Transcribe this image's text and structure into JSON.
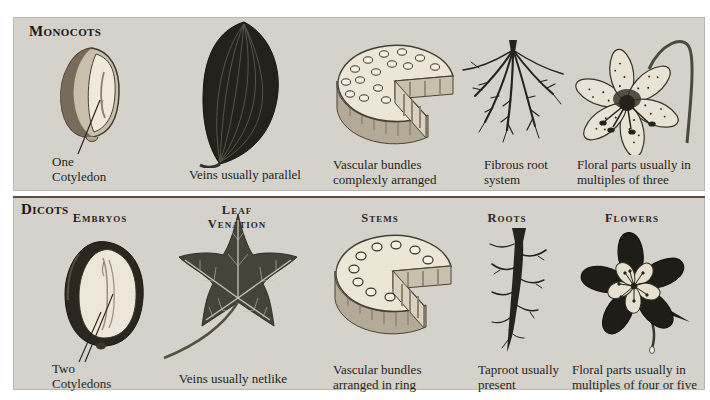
{
  "figure": {
    "colors": {
      "page_bg": "#ffffff",
      "panel_bg": "#d4d2cb",
      "divider": "#5d4a41",
      "text": "#241f19",
      "ink_dark": "#26221c",
      "paper_light": "#ece7d8"
    },
    "monocots": {
      "title": "Monocots",
      "columns": [
        {
          "illustration": "corn-seed",
          "caption": "One Cotyledon"
        },
        {
          "illustration": "parallel-vein-leaf",
          "caption": "Veins usually parallel"
        },
        {
          "illustration": "monocot-stem-cross-section",
          "caption": "Vascular bundles complexly arranged"
        },
        {
          "illustration": "fibrous-roots",
          "caption": "Fibrous root system"
        },
        {
          "illustration": "lily-flower",
          "caption": "Floral parts usually in multiples of three"
        }
      ]
    },
    "dicots": {
      "title": "Dicots",
      "headers": [
        "Embryos",
        "Leaf Venation",
        "Stems",
        "Roots",
        "Flowers"
      ],
      "columns": [
        {
          "illustration": "bean-seed",
          "caption": "Two Cotyledons"
        },
        {
          "illustration": "netlike-vein-leaf",
          "caption": "Veins usually netlike"
        },
        {
          "illustration": "dicot-stem-cross-section",
          "caption": "Vascular bundles arranged in ring"
        },
        {
          "illustration": "taproot",
          "caption": "Taproot usually present"
        },
        {
          "illustration": "columbine-flower",
          "caption": "Floral parts usually in multiples of four or five"
        }
      ]
    }
  }
}
